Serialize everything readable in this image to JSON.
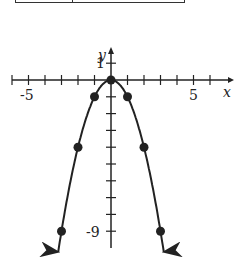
{
  "table_fragment": {
    "visible": true
  },
  "chart_data": {
    "type": "line",
    "title": "",
    "function": "y = -x^2",
    "xlabel": "x",
    "ylabel": "y",
    "xlim": [
      -6,
      7
    ],
    "ylim": [
      -10,
      2
    ],
    "x_tick_labels": [
      "-5",
      "5"
    ],
    "y_tick_labels": [
      "1",
      "-9"
    ],
    "grid": false,
    "series": [
      {
        "name": "y = -x^2",
        "x": [
          -3,
          -2,
          -1,
          0,
          1,
          2,
          3
        ],
        "y": [
          -9,
          -4,
          -1,
          0,
          -1,
          -4,
          -9
        ],
        "markers": true,
        "arrows_at_ends": true
      }
    ],
    "color": "#222222"
  },
  "labels": {
    "x_axis": "x",
    "y_axis": "y",
    "x_neg5": "-5",
    "x_pos5": "5",
    "y_1": "1",
    "y_neg9": "-9"
  }
}
